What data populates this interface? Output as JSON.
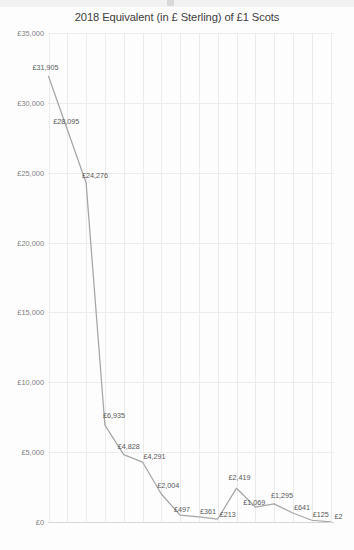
{
  "chart_data": {
    "type": "line",
    "title": "2018 Equivalent (in £ Sterling) of £1 Scots",
    "xlabel": "",
    "ylabel": "",
    "x": [
      1250,
      1300,
      1350,
      1400,
      1450,
      1500,
      1550,
      1600,
      1650,
      1700,
      1750,
      1800,
      1850,
      1900,
      1950,
      2000
    ],
    "categories": [
      "1250",
      "1300",
      "1350",
      "1400",
      "1450",
      "1500",
      "1550",
      "1600",
      "1650",
      "1700",
      "1750",
      "1800",
      "1850",
      "1900",
      "1950",
      "2000"
    ],
    "values": [
      31905,
      28095,
      24276,
      6935,
      4828,
      4291,
      2004,
      497,
      361,
      213,
      2419,
      1069,
      1295,
      641,
      125,
      2
    ],
    "point_labels": [
      "£31,905",
      "£28,095",
      "£24,276",
      "£6,935",
      "£4,828",
      "£4,291",
      "£2,004",
      "£497",
      "£361",
      "£213",
      "£2,419",
      "£1,069",
      "£1,295",
      "£641",
      "£125",
      "£2"
    ],
    "ylim": [
      0,
      35000
    ],
    "yticks": [
      0,
      5000,
      10000,
      15000,
      20000,
      25000,
      30000,
      35000
    ],
    "ytick_labels": [
      "£0",
      "£5,000",
      "£10,000",
      "£15,000",
      "£20,000",
      "£25,000",
      "£30,000",
      "£35,000"
    ],
    "grid": true,
    "legend": "none",
    "line_color": "#a6a6a6",
    "text_color": "#595959",
    "grid_color": "#ededed",
    "background": "#ffffff"
  }
}
